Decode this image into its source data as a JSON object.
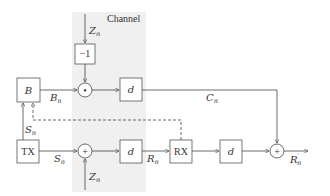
{
  "diagram": {
    "channel_region": {
      "label": "Channel",
      "fill": "#f0f0f0"
    },
    "blocks": {
      "b": {
        "label": "B"
      },
      "neg_one": {
        "label": "−1"
      },
      "delay_top": {
        "label": "d"
      },
      "tx": {
        "label": "TX"
      },
      "delay_mid": {
        "label": "d"
      },
      "rx": {
        "label": "RX"
      },
      "delay_right": {
        "label": "d"
      }
    },
    "operators": {
      "multiply": {
        "symbol": "•"
      },
      "add_channel": {
        "symbol": "+"
      },
      "add_output": {
        "symbol": "+"
      }
    },
    "signals": {
      "z_top": {
        "base": "Z",
        "sub": "n"
      },
      "b_n": {
        "base": "B",
        "sub": "n"
      },
      "c_n": {
        "base": "C",
        "sub": "n"
      },
      "s_n_feedback": {
        "base": "S",
        "sub": "n"
      },
      "s_n": {
        "base": "S",
        "sub": "n"
      },
      "z_bottom": {
        "base": "Z",
        "sub": "n"
      },
      "r_n": {
        "base": "R",
        "sub": "n"
      },
      "r_prime_n": {
        "base": "R",
        "prime": "′",
        "sub": "n"
      }
    }
  }
}
